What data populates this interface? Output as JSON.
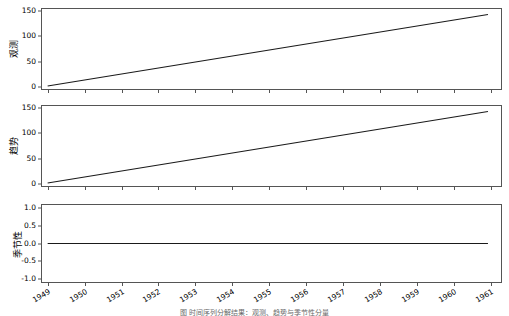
{
  "figure": {
    "width": 509,
    "height": 316,
    "background": "#ffffff",
    "line_color": "#1a1a1a",
    "axis_color": "#555555"
  },
  "chart_data": {
    "type": "line",
    "title": "",
    "xlabel": "",
    "grid": false,
    "legend": "none",
    "x_tick_labels": [
      "1949",
      "1950",
      "1951",
      "1952",
      "1953",
      "1954",
      "1955",
      "1956",
      "1957",
      "1958",
      "1959",
      "1960",
      "1961"
    ],
    "x_tick_values": [
      1949,
      1950,
      1951,
      1952,
      1953,
      1954,
      1955,
      1956,
      1957,
      1958,
      1959,
      1960,
      1961
    ],
    "xlim": [
      1948.82,
      1961.3
    ],
    "panels": [
      {
        "name": "observed",
        "ylabel": "观测",
        "ylim": [
          -7,
          157
        ],
        "y_tick_labels": [
          "0",
          "50",
          "100",
          "150"
        ],
        "y_tick_values": [
          0,
          50,
          100,
          150
        ],
        "series": [
          {
            "name": "observed",
            "x": [
              1949.0,
              1960.92
            ],
            "values": [
              1,
              144
            ]
          }
        ]
      },
      {
        "name": "trend",
        "ylabel": "趋势",
        "ylim": [
          -7,
          157
        ],
        "y_tick_labels": [
          "0",
          "50",
          "100",
          "150"
        ],
        "y_tick_values": [
          0,
          50,
          100,
          150
        ],
        "series": [
          {
            "name": "trend",
            "x": [
              1949.0,
              1960.92
            ],
            "values": [
              1,
              144
            ]
          }
        ]
      },
      {
        "name": "seasonal",
        "ylabel": "季节性",
        "ylim": [
          -1.12,
          1.12
        ],
        "y_tick_labels": [
          "1.0",
          "0.5",
          "0.0",
          "-0.5",
          "-1.0"
        ],
        "y_tick_values": [
          1.0,
          0.5,
          0.0,
          -0.5,
          -1.0
        ],
        "series": [
          {
            "name": "seasonal",
            "x": [
              1949.0,
              1960.92
            ],
            "values": [
              0.0,
              0.0
            ]
          }
        ]
      }
    ]
  },
  "caption": {
    "clipped_text": "图  时间序列分解结果：观测、趋势与季节性分量"
  }
}
